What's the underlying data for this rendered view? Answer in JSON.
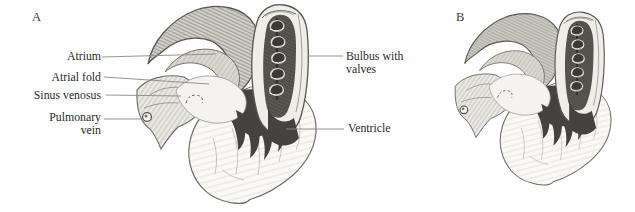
{
  "figure": {
    "panels": {
      "a": {
        "label": "A"
      },
      "b": {
        "label": "B"
      }
    },
    "annotations": {
      "atrium": "Atrium",
      "atrial_fold": "Atrial fold",
      "sinus_venosus": "Sinus venosus",
      "pulmonary_vein_line1": "Pulmonary",
      "pulmonary_vein_line2": "vein",
      "bulbus_line1": "Bulbus with",
      "bulbus_line2": "valves",
      "ventricle": "Ventricle"
    },
    "colors": {
      "paper": "#ffffff",
      "label_text": "#2b2b2b",
      "leader_line": "#8b8880",
      "sketch_outline": "#5f5d58",
      "shade_dark": "#45433f",
      "shade_mid": "#b6b3ac",
      "shade_light": "#e9e7e2"
    }
  }
}
